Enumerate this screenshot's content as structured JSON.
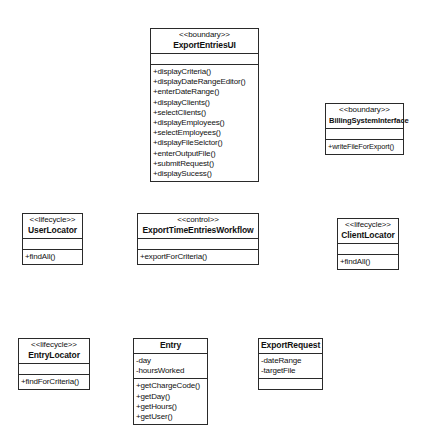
{
  "diagram": {
    "background_color": "#ffffff",
    "line_color": "#2a2a2a",
    "classes": [
      {
        "id": "export-entries-ui",
        "stereotype": "<<boundary>>",
        "name": "ExportEntriesUI",
        "attributes": [],
        "operations": [
          "+displayCriteria()",
          "+displayDateRangeEditor()",
          "+enterDateRange()",
          "+displayClients()",
          "+selectClients()",
          "+displayEmployees()",
          "+selectEmployees()",
          "+displayFileSelctor()",
          "+enterOutputFile()",
          "+submitRequest()",
          "+displaySucess()"
        ]
      },
      {
        "id": "billing-system-interface",
        "stereotype": "<<boundary>>",
        "name": "BillingSystemInterface",
        "attributes": [],
        "operations": [
          "+writeFileForExport()"
        ]
      },
      {
        "id": "user-locator",
        "stereotype": "<<lifecycle>>",
        "name": "UserLocator",
        "attributes": [],
        "operations": [
          "+findAll()"
        ]
      },
      {
        "id": "export-time-entries-workflow",
        "stereotype": "<<control>>",
        "name": "ExportTimeEntriesWorkflow",
        "attributes": [],
        "operations": [
          "+exportForCriteria()"
        ]
      },
      {
        "id": "client-locator",
        "stereotype": "<<lifecycle>>",
        "name": "ClientLocator",
        "attributes": [],
        "operations": [
          "+findAll()"
        ]
      },
      {
        "id": "entry-locator",
        "stereotype": "<<lifecycle>>",
        "name": "EntryLocator",
        "attributes": [],
        "operations": [
          "+findForCriteria()"
        ]
      },
      {
        "id": "entry",
        "stereotype": "",
        "name": "Entry",
        "attributes": [
          "-day",
          "-hoursWorked"
        ],
        "operations": [
          "+getChargeCode()",
          "+getDay()",
          "+getHours()",
          "+getUser()"
        ]
      },
      {
        "id": "export-request",
        "stereotype": "",
        "name": "ExportRequest",
        "attributes": [
          "-dateRange",
          "-targetFile"
        ],
        "operations": []
      }
    ]
  }
}
